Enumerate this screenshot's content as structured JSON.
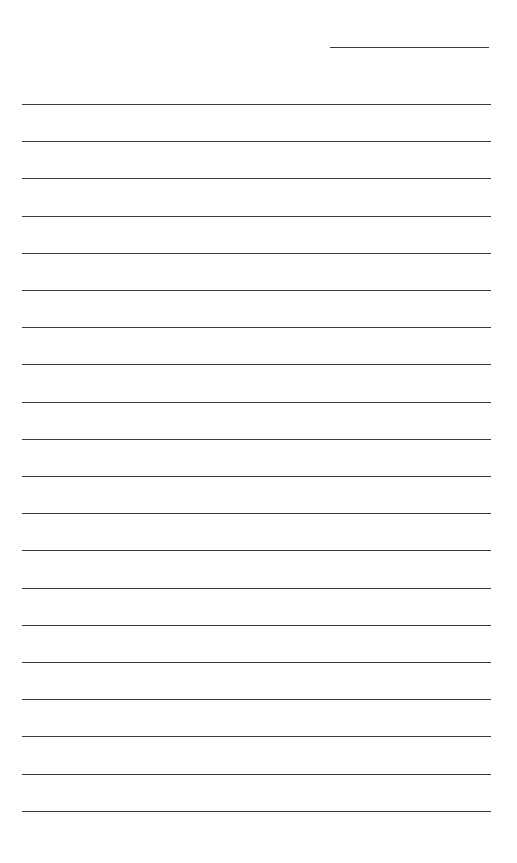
{
  "document": {
    "type": "lined-paper",
    "header_line": {
      "label": "",
      "present": true
    },
    "line_count": 20,
    "line_color": "#3a3a3a",
    "background": "#ffffff",
    "lines": [
      {
        "text": ""
      },
      {
        "text": ""
      },
      {
        "text": ""
      },
      {
        "text": ""
      },
      {
        "text": ""
      },
      {
        "text": ""
      },
      {
        "text": ""
      },
      {
        "text": ""
      },
      {
        "text": ""
      },
      {
        "text": ""
      },
      {
        "text": ""
      },
      {
        "text": ""
      },
      {
        "text": ""
      },
      {
        "text": ""
      },
      {
        "text": ""
      },
      {
        "text": ""
      },
      {
        "text": ""
      },
      {
        "text": ""
      },
      {
        "text": ""
      },
      {
        "text": ""
      }
    ]
  }
}
